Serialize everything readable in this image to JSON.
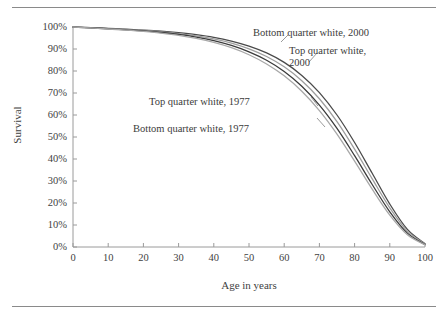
{
  "figure": {
    "background_color": "#ffffff",
    "rule_color": "#8a8a8a"
  },
  "axes": {
    "x_title": "Age in years",
    "y_title": "Survival",
    "x_ticks": [
      "0",
      "10",
      "20",
      "30",
      "40",
      "50",
      "60",
      "70",
      "80",
      "90",
      "100"
    ],
    "y_ticks": [
      "100%",
      "90%",
      "80%",
      "70%",
      "60%",
      "50%",
      "40%",
      "30%",
      "20%",
      "10%",
      "0%"
    ],
    "axis_color": "#9a9a9a"
  },
  "annotations": [
    {
      "id": "bottom-2000",
      "text": "Bottom quarter white, 2000"
    },
    {
      "id": "top-2000",
      "text": "Top quarter white,\n2000"
    },
    {
      "id": "top-2000-line1",
      "text": "Top quarter white,"
    },
    {
      "id": "top-2000-line2",
      "text": "2000"
    },
    {
      "id": "top-1977",
      "text": "Top quarter white, 1977"
    },
    {
      "id": "bottom-1977",
      "text": "Bottom quarter white, 1977"
    }
  ],
  "chart_data": {
    "type": "line",
    "title": "",
    "xlabel": "Age in years",
    "ylabel": "Survival",
    "xlim": [
      0,
      100
    ],
    "ylim": [
      0,
      100
    ],
    "xticks": [
      0,
      10,
      20,
      30,
      40,
      50,
      60,
      70,
      80,
      90,
      100
    ],
    "yticks": [
      0,
      10,
      20,
      30,
      40,
      50,
      60,
      70,
      80,
      90,
      100
    ],
    "y_tick_format": "percent",
    "grid": false,
    "legend_position": "inline-annotations",
    "x": [
      0,
      5,
      10,
      15,
      20,
      25,
      30,
      35,
      40,
      45,
      50,
      55,
      60,
      65,
      70,
      75,
      80,
      85,
      90,
      95,
      100
    ],
    "series": [
      {
        "name": "Bottom quarter white, 2000",
        "color": "#4a4a4a",
        "width": 1.3,
        "values": [
          100,
          99.7,
          99.4,
          99.0,
          98.6,
          98.1,
          97.4,
          96.5,
          95.3,
          93.6,
          91.3,
          88.2,
          83.9,
          78.0,
          70.2,
          60.0,
          47.5,
          33.5,
          19.5,
          8.0,
          1.5
        ]
      },
      {
        "name": "Top quarter white, 2000",
        "color": "#9e9e9e",
        "width": 1.3,
        "values": [
          100,
          99.7,
          99.3,
          98.9,
          98.4,
          97.8,
          97.0,
          96.0,
          94.6,
          92.7,
          90.1,
          86.6,
          81.9,
          75.6,
          67.4,
          57.0,
          44.5,
          31.0,
          17.8,
          7.2,
          1.3
        ]
      },
      {
        "name": "Top quarter white, 1977",
        "color": "#3a3a3a",
        "width": 1.3,
        "values": [
          100,
          99.6,
          99.2,
          98.7,
          98.2,
          97.5,
          96.6,
          95.4,
          93.8,
          91.6,
          88.7,
          84.9,
          79.8,
          73.1,
          64.5,
          53.9,
          41.5,
          28.4,
          16.0,
          6.3,
          1.1
        ]
      },
      {
        "name": "Bottom quarter white, 1977",
        "color": "#a8a8a8",
        "width": 1.3,
        "values": [
          100,
          99.6,
          99.1,
          98.6,
          98.0,
          97.2,
          96.2,
          94.8,
          93.0,
          90.6,
          87.4,
          83.2,
          77.8,
          70.8,
          62.0,
          51.3,
          39.0,
          26.3,
          14.5,
          5.6,
          1.0
        ]
      }
    ]
  }
}
